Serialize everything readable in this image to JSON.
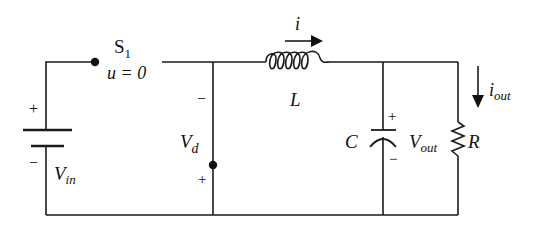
{
  "diagram": {
    "colors": {
      "wire": "#1a1a1a",
      "background": "#ffffff"
    },
    "switch": {
      "name": "S",
      "subscript": "1",
      "state_label": "u = 0"
    },
    "source": {
      "name": "V",
      "subscript": "in",
      "plus": "+",
      "minus": "−"
    },
    "diode_voltage": {
      "name": "V",
      "subscript": "d",
      "plus": "+",
      "minus": "−"
    },
    "inductor": {
      "name": "L",
      "current": "i"
    },
    "capacitor": {
      "name": "C",
      "plus": "+",
      "minus": "−"
    },
    "output_voltage": {
      "name": "V",
      "subscript": "out"
    },
    "resistor": {
      "name": "R"
    },
    "output_current": {
      "name": "i",
      "subscript": "out"
    }
  }
}
